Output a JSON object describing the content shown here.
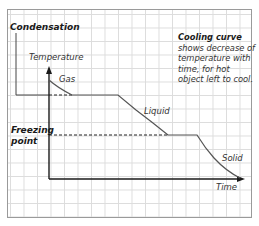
{
  "diagram": {
    "title_cropped": "...",
    "labels": {
      "condensation": "Condensation",
      "y_axis": "Temperature",
      "x_axis": "Time",
      "gas": "Gas",
      "liquid": "Liquid",
      "solid": "Solid",
      "freezing_point_line1": "Freezing",
      "freezing_point_line2": "point"
    },
    "note": {
      "title": "Cooling curve",
      "body": "shows decrease of temperature with time, for hot object left to cool."
    },
    "colors": {
      "curve": "#555555",
      "axes": "#1a1a1a",
      "grid": "#dcdcdc",
      "border": "#9a9a9a"
    },
    "segments": [
      {
        "phase": "Gas",
        "type": "cooling",
        "from": [
          49,
          80
        ],
        "to": [
          72,
          95
        ]
      },
      {
        "phase": "Condensation",
        "type": "plateau",
        "from": [
          72,
          95
        ],
        "to": [
          118,
          95
        ]
      },
      {
        "phase": "Liquid",
        "type": "cooling",
        "from": [
          118,
          95
        ],
        "to": [
          168,
          135
        ]
      },
      {
        "phase": "Freezing",
        "type": "plateau",
        "from": [
          168,
          135
        ],
        "to": [
          197,
          135
        ]
      },
      {
        "phase": "Solid",
        "type": "cooling",
        "from": [
          197,
          135
        ],
        "to": [
          240,
          178
        ]
      }
    ]
  }
}
